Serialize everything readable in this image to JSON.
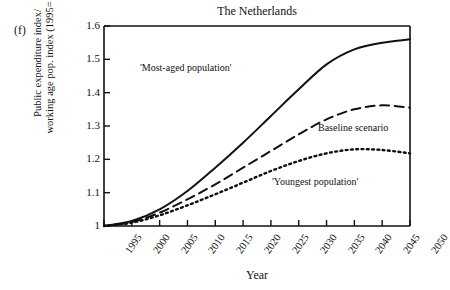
{
  "panel_label": "(f)",
  "axis": {
    "ylabel_line1": "Public expenditure index/",
    "ylabel_line2": "working age pop. index (1995=1)",
    "xlabel": "Year"
  },
  "annotations": {
    "most_aged": "'Most-aged population'",
    "baseline": "Baseline scenario",
    "youngest": "'Youngest population'"
  },
  "colors": {
    "ink": "#111111",
    "background": "#ffffff"
  },
  "chart_data": {
    "type": "line",
    "title": "The Netherlands",
    "xlabel": "Year",
    "ylabel": "Public expenditure index/ working age pop. index (1995=1)",
    "xlim": [
      1995,
      2050
    ],
    "ylim": [
      1.0,
      1.6
    ],
    "xticks": [
      1995,
      2000,
      2005,
      2010,
      2015,
      2020,
      2025,
      2030,
      2035,
      2040,
      2045,
      2050
    ],
    "yticks": [
      "1",
      "1.1",
      "1.2",
      "1.3",
      "1.4",
      "1.5",
      "1.6"
    ],
    "grid": false,
    "legend_position": "inline-annotations",
    "x": [
      1995,
      2000,
      2005,
      2010,
      2015,
      2020,
      2025,
      2030,
      2035,
      2040,
      2045,
      2050
    ],
    "series": [
      {
        "name": "'Most-aged population'",
        "style": "solid",
        "values": [
          1.0,
          1.015,
          1.05,
          1.105,
          1.175,
          1.25,
          1.33,
          1.41,
          1.485,
          1.53,
          1.55,
          1.56
        ]
      },
      {
        "name": "Baseline scenario",
        "style": "dashed",
        "values": [
          1.0,
          1.012,
          1.04,
          1.08,
          1.125,
          1.175,
          1.225,
          1.275,
          1.32,
          1.35,
          1.362,
          1.355
        ]
      },
      {
        "name": "'Youngest population'",
        "style": "dotted",
        "values": [
          1.0,
          1.01,
          1.032,
          1.062,
          1.095,
          1.13,
          1.165,
          1.195,
          1.218,
          1.23,
          1.228,
          1.218
        ]
      }
    ]
  }
}
